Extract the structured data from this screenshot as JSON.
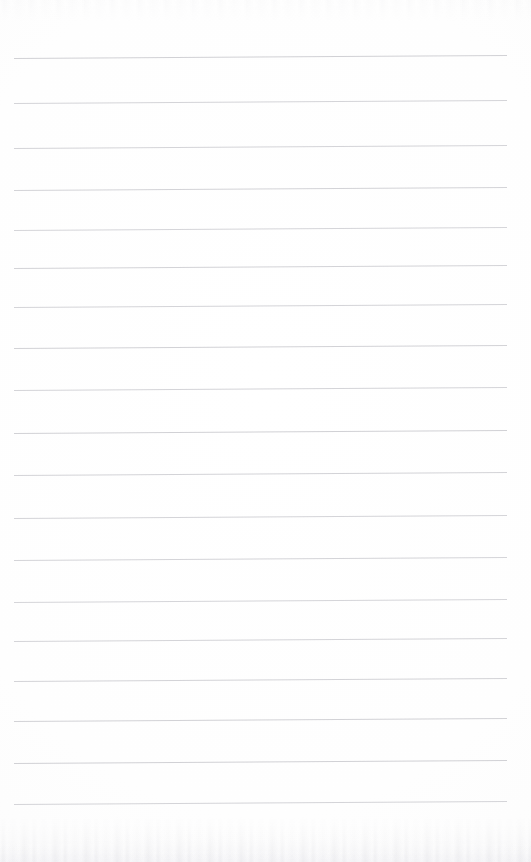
{
  "document": {
    "kind": "scanned-lined-notepad-page",
    "title": "Blank lined notepad page",
    "page_width": 531,
    "page_height": 862,
    "paper_color": "#fefefe",
    "rule_color": "#c9c9ce",
    "content_text": "",
    "has_handwriting": false,
    "has_margin_rule": false,
    "has_header": false,
    "has_page_number": false
  },
  "ruling": {
    "line_count": 19,
    "line_start_x": 14,
    "line_end_x": 507,
    "line_thickness": 1,
    "average_spacing": 42.5,
    "skew_degrees": -0.35,
    "color": "#c9c9ce",
    "lines": [
      {
        "y": 58,
        "opacity": 0.85,
        "thickness": 1.0
      },
      {
        "y": 103,
        "opacity": 0.8,
        "thickness": 1.0
      },
      {
        "y": 148,
        "opacity": 0.8,
        "thickness": 1.0
      },
      {
        "y": 190,
        "opacity": 0.82,
        "thickness": 1.0
      },
      {
        "y": 230,
        "opacity": 0.78,
        "thickness": 1.0
      },
      {
        "y": 268,
        "opacity": 0.82,
        "thickness": 1.0
      },
      {
        "y": 307,
        "opacity": 0.8,
        "thickness": 1.0
      },
      {
        "y": 348,
        "opacity": 0.84,
        "thickness": 1.0
      },
      {
        "y": 390,
        "opacity": 0.8,
        "thickness": 1.0
      },
      {
        "y": 433,
        "opacity": 0.86,
        "thickness": 1.0
      },
      {
        "y": 475,
        "opacity": 0.82,
        "thickness": 1.0
      },
      {
        "y": 518,
        "opacity": 0.8,
        "thickness": 1.0
      },
      {
        "y": 560,
        "opacity": 0.8,
        "thickness": 1.0
      },
      {
        "y": 602,
        "opacity": 0.78,
        "thickness": 1.0
      },
      {
        "y": 641,
        "opacity": 0.8,
        "thickness": 1.0
      },
      {
        "y": 681,
        "opacity": 0.82,
        "thickness": 1.0
      },
      {
        "y": 721,
        "opacity": 0.84,
        "thickness": 1.0
      },
      {
        "y": 763,
        "opacity": 0.86,
        "thickness": 1.0
      },
      {
        "y": 804,
        "opacity": 0.8,
        "thickness": 1.0
      }
    ]
  },
  "scan_artifacts": {
    "bottom_noise_band_height": 46,
    "top_noise_band_height": 22,
    "noise_color": "#c4c4ca",
    "vignette": true
  }
}
